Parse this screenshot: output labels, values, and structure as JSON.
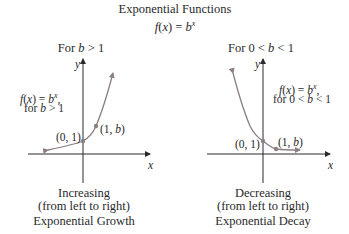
{
  "title": "Exponential Functions",
  "formula": {
    "f": "f",
    "x": "x",
    "eq": ") = ",
    "b": "b",
    "exp": "x"
  },
  "panels": [
    {
      "heading_prefix": "For ",
      "heading_var": "b",
      "heading_suffix": " > 1",
      "annotation_line1_f": "f",
      "annotation_line1_x": "x",
      "annotation_line1_b": "b",
      "annotation_line1_exp": "x",
      "annotation_line2_prefix": "for ",
      "annotation_line2_var": "b",
      "annotation_line2_suffix": " > 1",
      "point1": "(0, 1)",
      "point2_prefix": "(1, ",
      "point2_var": "b",
      "point2_suffix": ")",
      "axis_x": "x",
      "axis_y": "y",
      "caption1": "Increasing",
      "caption2": "(from left to right)",
      "caption3": "Exponential Growth"
    },
    {
      "heading_prefix": "For 0 < ",
      "heading_var": "b",
      "heading_suffix": " < 1",
      "annotation_line1_f": "f",
      "annotation_line1_x": "x",
      "annotation_line1_b": "b",
      "annotation_line1_exp": "x",
      "annotation_line2_prefix": "for 0 < ",
      "annotation_line2_var": "b",
      "annotation_line2_suffix": " < 1",
      "point1": "(0, 1)",
      "point2_prefix": "(1, ",
      "point2_var": "b",
      "point2_suffix": ")",
      "axis_x": "x",
      "axis_y": "y",
      "caption1": "Decreasing",
      "caption2": "(from left to right)",
      "caption3": "Exponential Decay"
    }
  ],
  "colors": {
    "curve": "#8c7f84",
    "axis": "#2a2a2a",
    "text": "#2a2a2a"
  }
}
